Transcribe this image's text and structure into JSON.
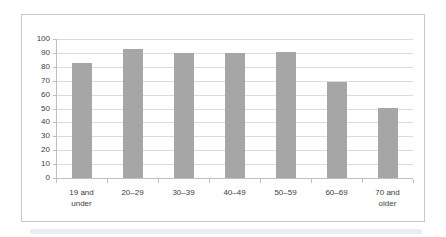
{
  "chart_data": {
    "type": "bar",
    "title": "",
    "xlabel": "",
    "ylabel": "",
    "categories": [
      "19 and\nunder",
      "20–29",
      "30–39",
      "40–49",
      "50–59",
      "60–69",
      "70 and\nolder"
    ],
    "values": [
      83,
      93,
      90,
      90,
      91,
      69,
      50
    ],
    "ylim": [
      0,
      100
    ],
    "ytick_labels": [
      "0",
      "10",
      "20",
      "30",
      "40",
      "50",
      "60",
      "70",
      "80",
      "90",
      "100"
    ],
    "grid": "horizontal",
    "legend": "none",
    "colors": {
      "bar": "#a6a6a6",
      "gridline": "#dcdcdc",
      "axis": "#bfbfbf",
      "text": "#404040",
      "frame_border": "#c9c9c9",
      "background": "#ffffff"
    }
  }
}
